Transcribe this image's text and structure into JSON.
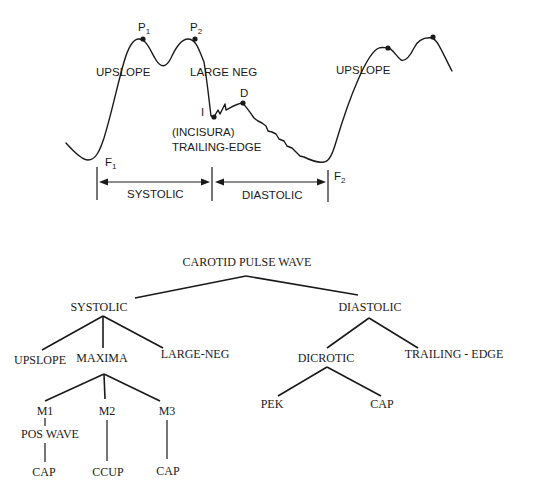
{
  "waveform": {
    "labels": {
      "p1": "P",
      "p1_sub": "1",
      "p2": "P",
      "p2_sub": "2",
      "upslope_left": "UPSLOPE",
      "large_neg": "LARGE NEG",
      "incisura_point": "I",
      "dicrotic_point": "D",
      "incisura": "(INCISURA)",
      "trailing_edge": "TRAILING-EDGE",
      "f1": "F",
      "f1_sub": "1",
      "f2": "F",
      "f2_sub": "2",
      "upslope_right": "UPSLOPE"
    },
    "phases": {
      "systolic": "SYSTOLIC",
      "diastolic": "DIASTOLIC"
    }
  },
  "tree": {
    "root": "CAROTID PULSE WAVE",
    "systolic": {
      "label": "SYSTOLIC",
      "children": {
        "upslope": "UPSLOPE",
        "maxima": "MAXIMA",
        "large_neg": "LARGE-NEG"
      },
      "maxima_children": {
        "m1": "M1",
        "m1_child": "POS WAVE",
        "m1_leaf": "CAP",
        "m2": "M2",
        "m2_leaf": "CCUP",
        "m3": "M3",
        "m3_leaf": "CAP"
      }
    },
    "diastolic": {
      "label": "DIASTOLIC",
      "children": {
        "dicrotic": "DICROTIC",
        "trailing_edge": "TRAILING - EDGE"
      },
      "dicrotic_children": {
        "pek": "PEK",
        "cap": "CAP"
      }
    }
  }
}
